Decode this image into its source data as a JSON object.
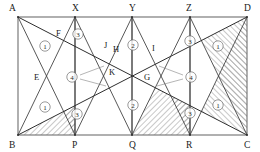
{
  "figure": {
    "type": "geometry-diagram",
    "canvas": {
      "width": 260,
      "height": 152
    },
    "colors": {
      "stroke": "#3a3a3a",
      "rect_edge": "#6f6f6f",
      "diagonal": "#2e2e2e",
      "hatch": "#9a9a9a",
      "label": "#1a1a1a",
      "background": "#ffffff"
    },
    "rect": {
      "left": 18,
      "top": 17,
      "right": 247,
      "bottom": 135
    },
    "vertices": [
      {
        "name": "A",
        "x": 18,
        "y": 17,
        "lx": 9,
        "ly": 11,
        "role": "rect-corner-top-left"
      },
      {
        "name": "X",
        "x": 75,
        "y": 17,
        "lx": 72,
        "ly": 11,
        "role": "top-edge-point"
      },
      {
        "name": "Y",
        "x": 132,
        "y": 17,
        "lx": 129,
        "ly": 11,
        "role": "top-edge-point"
      },
      {
        "name": "Z",
        "x": 190,
        "y": 17,
        "lx": 186,
        "ly": 11,
        "role": "top-edge-point"
      },
      {
        "name": "D",
        "x": 247,
        "y": 17,
        "lx": 244,
        "ly": 11,
        "role": "rect-corner-top-right"
      },
      {
        "name": "B",
        "x": 18,
        "y": 135,
        "lx": 9,
        "ly": 148,
        "role": "rect-corner-bottom-left"
      },
      {
        "name": "P",
        "x": 75,
        "y": 135,
        "lx": 72,
        "ly": 148,
        "role": "bottom-edge-point"
      },
      {
        "name": "Q",
        "x": 132,
        "y": 135,
        "lx": 129,
        "ly": 148,
        "role": "bottom-edge-point"
      },
      {
        "name": "R",
        "x": 190,
        "y": 135,
        "lx": 186,
        "ly": 148,
        "role": "bottom-edge-point"
      },
      {
        "name": "C",
        "x": 247,
        "y": 135,
        "lx": 244,
        "ly": 148,
        "role": "rect-corner-bottom-right"
      }
    ],
    "interior_points": [
      {
        "name": "E",
        "x": 47,
        "y": 77,
        "lx": 34,
        "ly": 80
      },
      {
        "name": "F",
        "x": 67,
        "y": 39,
        "lx": 56,
        "ly": 36
      },
      {
        "name": "G",
        "x": 157,
        "y": 77,
        "lx": 144,
        "ly": 80
      },
      {
        "name": "H",
        "x": 122,
        "y": 55,
        "lx": 113,
        "ly": 52
      },
      {
        "name": "I",
        "x": 160,
        "y": 55,
        "lx": 152,
        "ly": 51
      },
      {
        "name": "J",
        "x": 113,
        "y": 50,
        "lx": 104,
        "ly": 48
      },
      {
        "name": "K",
        "x": 120,
        "y": 77,
        "lx": 109,
        "ly": 75
      }
    ],
    "region_labels": [
      {
        "id": "1",
        "text": "①",
        "x": 45,
        "y": 46
      },
      {
        "id": "3",
        "text": "③",
        "x": 78,
        "y": 34
      },
      {
        "id": "2",
        "text": "②",
        "x": 133,
        "y": 45
      },
      {
        "id": "3",
        "text": "③",
        "x": 190,
        "y": 41
      },
      {
        "id": "1",
        "text": "①",
        "x": 218,
        "y": 46
      },
      {
        "id": "4",
        "text": "④",
        "x": 72,
        "y": 77
      },
      {
        "id": "4",
        "text": "④",
        "x": 191,
        "y": 77
      },
      {
        "id": "1",
        "text": "①",
        "x": 45,
        "y": 107
      },
      {
        "id": "3",
        "text": "③",
        "x": 77,
        "y": 114
      },
      {
        "id": "2",
        "text": "②",
        "x": 133,
        "y": 105
      },
      {
        "id": "3",
        "text": "③",
        "x": 190,
        "y": 113
      },
      {
        "id": "1",
        "text": "①",
        "x": 218,
        "y": 105
      }
    ],
    "zigzag_top": [
      {
        "from": "A",
        "to": "P"
      },
      {
        "from": "P",
        "to": "X"
      },
      {
        "from": "X",
        "to": "Q"
      },
      {
        "from": "Q",
        "to": "Y"
      },
      {
        "from": "Y",
        "to": "R"
      },
      {
        "from": "R",
        "to": "Z"
      },
      {
        "from": "Z",
        "to": "C"
      }
    ],
    "zigzag_bottom": [
      {
        "from": "B",
        "to": "X"
      },
      {
        "from": "X",
        "to": "P"
      },
      {
        "from": "P",
        "to": "Y"
      },
      {
        "from": "Y",
        "to": "Q"
      },
      {
        "from": "Q",
        "to": "Z"
      },
      {
        "from": "Z",
        "to": "R"
      },
      {
        "from": "R",
        "to": "D"
      }
    ],
    "diagonals": [
      {
        "from": "A",
        "to": "C"
      },
      {
        "from": "B",
        "to": "D"
      }
    ],
    "leaders": [
      {
        "from_x": 80,
        "from_y": 75,
        "to_x": 104,
        "to_y": 66
      },
      {
        "from_x": 80,
        "from_y": 79,
        "to_x": 106,
        "to_y": 86
      },
      {
        "from_x": 183,
        "from_y": 75,
        "to_x": 159,
        "to_y": 66
      },
      {
        "from_x": 183,
        "from_y": 79,
        "to_x": 157,
        "to_y": 86
      }
    ]
  }
}
